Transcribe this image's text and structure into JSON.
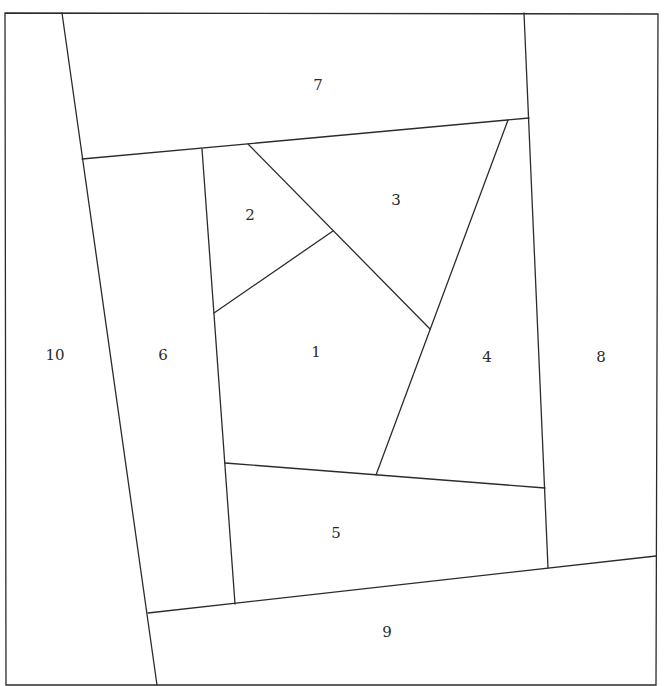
{
  "diagram": {
    "type": "foundation-piecing-block",
    "line_color": "#2b2b2b",
    "background": "#ffffff",
    "border": [
      [
        5,
        13
      ],
      [
        658,
        14
      ],
      [
        656,
        685
      ],
      [
        6,
        685
      ]
    ],
    "seams": [
      {
        "name": "seam-10-edge",
        "from": [
          62,
          13
        ],
        "to": [
          157,
          685
        ]
      },
      {
        "name": "seam-7-bottom",
        "from": [
          82,
          159
        ],
        "to": [
          529,
          118
        ]
      },
      {
        "name": "seam-8-left",
        "from": [
          524,
          13
        ],
        "to": [
          548,
          568
        ]
      },
      {
        "name": "seam-9-top",
        "from": [
          148,
          613
        ],
        "to": [
          656,
          556
        ]
      },
      {
        "name": "seam-6-right",
        "from": [
          202,
          149
        ],
        "to": [
          235,
          604
        ]
      },
      {
        "name": "seam-5-top",
        "from": [
          225,
          463
        ],
        "to": [
          545,
          488
        ]
      },
      {
        "name": "seam-2-3",
        "from": [
          248,
          144
        ],
        "to": [
          430,
          329
        ]
      },
      {
        "name": "seam-2-1",
        "from": [
          214,
          313
        ],
        "to": [
          333,
          231
        ]
      },
      {
        "name": "seam-3-4",
        "from": [
          508,
          120
        ],
        "to": [
          376,
          475
        ]
      }
    ],
    "pieces": [
      {
        "id": "1",
        "label": "1",
        "x": 316,
        "y": 352
      },
      {
        "id": "2",
        "label": "2",
        "x": 250,
        "y": 215
      },
      {
        "id": "3",
        "label": "3",
        "x": 396,
        "y": 200
      },
      {
        "id": "4",
        "label": "4",
        "x": 487,
        "y": 357
      },
      {
        "id": "5",
        "label": "5",
        "x": 336,
        "y": 533
      },
      {
        "id": "6",
        "label": "6",
        "x": 163,
        "y": 355
      },
      {
        "id": "7",
        "label": "7",
        "x": 318,
        "y": 85
      },
      {
        "id": "8",
        "label": "8",
        "x": 601,
        "y": 357
      },
      {
        "id": "9",
        "label": "9",
        "x": 387,
        "y": 632
      },
      {
        "id": "10",
        "label": "10",
        "x": 55,
        "y": 355
      }
    ]
  }
}
